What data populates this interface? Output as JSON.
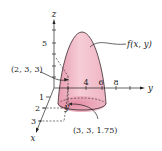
{
  "figure": {
    "axes": {
      "x_label": "x",
      "y_label": "y",
      "z_label": "z",
      "x_ticks": [
        "1",
        "2",
        "3"
      ],
      "y_ticks": [
        "4",
        "6",
        "8"
      ],
      "z_ticks": [
        "5"
      ]
    },
    "annotations": {
      "surface": "f(x, y)",
      "point_top": "(2, 3, 3)",
      "point_bottom": "(3, 3, 1.75)"
    },
    "colors": {
      "surface_fill": "#f4c6d0",
      "surface_shade": "#e89aae",
      "outline": "#3a2a2e"
    }
  }
}
